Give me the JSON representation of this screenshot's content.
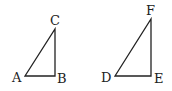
{
  "diagram": {
    "triangles": [
      {
        "name": "ABC",
        "vertices": {
          "A": {
            "label": "A",
            "x": 25,
            "y": 76
          },
          "B": {
            "label": "B",
            "x": 55,
            "y": 76
          },
          "C": {
            "label": "C",
            "x": 55,
            "y": 29
          }
        },
        "right_angle_at": "B"
      },
      {
        "name": "DEF",
        "vertices": {
          "D": {
            "label": "D",
            "x": 115,
            "y": 76
          },
          "E": {
            "label": "E",
            "x": 151,
            "y": 76
          },
          "F": {
            "label": "F",
            "x": 151,
            "y": 19
          }
        },
        "right_angle_at": "E"
      }
    ],
    "stroke_color": "#222222",
    "background": "#ffffff"
  }
}
